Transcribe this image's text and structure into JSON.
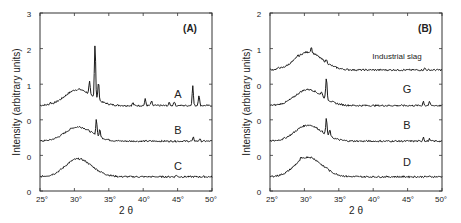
{
  "chart_data": [
    {
      "type": "line",
      "panel_label": "(A)",
      "xlabel": "2 θ",
      "ylabel": "Intensity (arbitrary units)",
      "xlim": [
        25,
        50
      ],
      "x_ticks": [
        "25°",
        "30°",
        "35°",
        "40°",
        "45°",
        "50°"
      ],
      "y_ticks": [
        "0",
        "0",
        "0",
        "1",
        "2",
        "3"
      ],
      "grid": false,
      "legend": "inline labels",
      "series": [
        {
          "name": "A",
          "baseline": 0.4,
          "hump_center": 30.5,
          "hump_height": 0.45,
          "peaks": [
            {
              "x": 26.5,
              "h": 0.05
            },
            {
              "x": 32.2,
              "h": 0.35
            },
            {
              "x": 33.0,
              "h": 1.5
            },
            {
              "x": 33.5,
              "h": 0.5
            },
            {
              "x": 38.5,
              "h": 0.08
            },
            {
              "x": 40.3,
              "h": 0.18
            },
            {
              "x": 41.2,
              "h": 0.12
            },
            {
              "x": 43.8,
              "h": 0.08
            },
            {
              "x": 44.5,
              "h": 0.12
            },
            {
              "x": 47.2,
              "h": 0.55
            },
            {
              "x": 48.1,
              "h": 0.3
            }
          ]
        },
        {
          "name": "B",
          "baseline": -0.6,
          "hump_center": 30.5,
          "hump_height": 0.4,
          "peaks": [
            {
              "x": 33.2,
              "h": 0.45
            },
            {
              "x": 33.7,
              "h": 0.2
            },
            {
              "x": 47.3,
              "h": 0.1
            },
            {
              "x": 48.2,
              "h": 0.06
            }
          ]
        },
        {
          "name": "C",
          "baseline": -1.6,
          "hump_center": 30.5,
          "hump_height": 0.5,
          "peaks": [
            {
              "x": 44.8,
              "h": 0.05
            }
          ]
        }
      ]
    },
    {
      "type": "line",
      "panel_label": "(B)",
      "xlabel": "2 θ",
      "ylabel": "Intensity (arbitrary units)",
      "xlim": [
        25,
        50
      ],
      "x_ticks": [
        "25°",
        "30°",
        "35°",
        "40°",
        "45°",
        "50°"
      ],
      "y_ticks": [
        "0",
        "0",
        "0",
        "0",
        "1",
        "2"
      ],
      "grid": false,
      "legend": "inline labels",
      "series": [
        {
          "name": "Industrial slag",
          "baseline": 0.4,
          "hump_center": 30.5,
          "hump_height": 0.5,
          "peaks": [
            {
              "x": 26.3,
              "h": 0.05
            },
            {
              "x": 29.0,
              "h": 0.06
            },
            {
              "x": 31.0,
              "h": 0.15
            },
            {
              "x": 33.2,
              "h": 0.08
            },
            {
              "x": 47.5,
              "h": 0.05
            }
          ]
        },
        {
          "name": "G",
          "baseline": -0.6,
          "hump_center": 30.5,
          "hump_height": 0.45,
          "peaks": [
            {
              "x": 32.5,
              "h": 0.12
            },
            {
              "x": 33.2,
              "h": 0.6
            },
            {
              "x": 47.3,
              "h": 0.12
            },
            {
              "x": 48.2,
              "h": 0.1
            }
          ]
        },
        {
          "name": "B",
          "baseline": -1.6,
          "hump_center": 30.5,
          "hump_height": 0.45,
          "peaks": [
            {
              "x": 33.2,
              "h": 0.45
            },
            {
              "x": 33.7,
              "h": 0.18
            },
            {
              "x": 47.3,
              "h": 0.12
            },
            {
              "x": 48.2,
              "h": 0.06
            }
          ]
        },
        {
          "name": "D",
          "baseline": -2.6,
          "hump_center": 30.5,
          "hump_height": 0.55,
          "peaks": [
            {
              "x": 29.5,
              "h": 0.06
            },
            {
              "x": 33.3,
              "h": 0.05
            }
          ]
        }
      ]
    }
  ],
  "panels": [
    {
      "label": "(A)",
      "xlabel": "2 θ",
      "ylabel": "Intensity (arbitrary units)",
      "y_tick_labels": [
        "3",
        "2",
        "1",
        "0",
        "0",
        "0"
      ],
      "x_tick_labels": [
        "25°",
        "30°",
        "35°",
        "40°",
        "45°",
        "50°"
      ],
      "curve_labels": [
        "A",
        "B",
        "C"
      ]
    },
    {
      "label": "(B)",
      "xlabel": "2 θ",
      "ylabel": "Intensity (arbitrary units)",
      "y_tick_labels": [
        "2",
        "1",
        "0",
        "0",
        "0",
        "0"
      ],
      "x_tick_labels": [
        "25°",
        "30°",
        "35°",
        "40°",
        "45°",
        "50°"
      ],
      "curve_labels": [
        "Industrial slag",
        "G",
        "B",
        "D"
      ]
    }
  ]
}
